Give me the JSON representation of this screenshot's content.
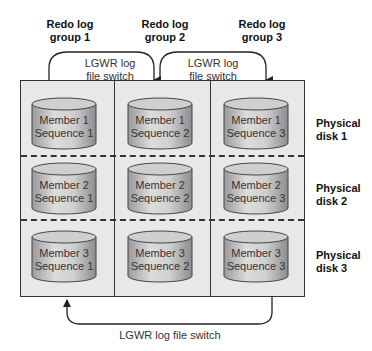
{
  "groups": [
    {
      "label_line1": "Redo log",
      "label_line2": "group 1"
    },
    {
      "label_line1": "Redo log",
      "label_line2": "group 2"
    },
    {
      "label_line1": "Redo log",
      "label_line2": "group 3"
    }
  ],
  "switches": {
    "top_1": {
      "line1": "LGWR log",
      "line2": "file switch"
    },
    "top_2": {
      "line1": "LGWR log",
      "line2": "file switch"
    },
    "bottom": "LGWR log file switch"
  },
  "disks": [
    {
      "line1": "Physical",
      "line2": "disk 1"
    },
    {
      "line1": "Physical",
      "line2": "disk 2"
    },
    {
      "line1": "Physical",
      "line2": "disk 3"
    }
  ],
  "cells": [
    [
      {
        "member": "Member 1",
        "sequence": "Sequence 1"
      },
      {
        "member": "Member 1",
        "sequence": "Sequence 2"
      },
      {
        "member": "Member 1",
        "sequence": "Sequence 3"
      }
    ],
    [
      {
        "member": "Member 2",
        "sequence": "Sequence 1"
      },
      {
        "member": "Member 2",
        "sequence": "Sequence 2"
      },
      {
        "member": "Member 2",
        "sequence": "Sequence 3"
      }
    ],
    [
      {
        "member": "Member 3",
        "sequence": "Sequence 1"
      },
      {
        "member": "Member 3",
        "sequence": "Sequence 2"
      },
      {
        "member": "Member 3",
        "sequence": "Sequence 3"
      }
    ]
  ]
}
